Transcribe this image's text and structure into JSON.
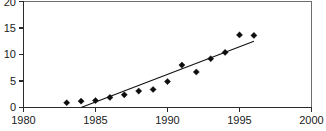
{
  "chart_data": {
    "type": "scatter",
    "title": "",
    "subtitle": "",
    "xlabel": "",
    "ylabel": "",
    "xlim": [
      1980,
      2000
    ],
    "ylim": [
      0,
      20
    ],
    "grid": false,
    "legend": "none",
    "x_ticks": [
      1980,
      1985,
      1990,
      1995,
      2000
    ],
    "x_tick_labels": [
      "1980",
      "1985",
      "1990",
      "1995",
      "2000"
    ],
    "y_ticks": [
      0,
      5,
      10,
      15,
      20
    ],
    "y_tick_labels": [
      "0",
      "5",
      "10",
      "15",
      "20"
    ],
    "series": [
      {
        "name": "data-points",
        "kind": "scatter",
        "marker": "diamond",
        "color": "#0d0d0d",
        "x": [
          1983,
          1984,
          1985,
          1986,
          1987,
          1988,
          1989,
          1990,
          1991,
          1992,
          1993,
          1994,
          1995,
          1996
        ],
        "values": [
          0.9,
          1.2,
          1.3,
          1.9,
          2.4,
          3.1,
          3.4,
          4.9,
          8.0,
          6.7,
          9.2,
          10.4,
          13.7,
          13.6
        ]
      },
      {
        "name": "trend-line",
        "kind": "line",
        "color": "#111111",
        "x": [
          1984.0,
          1996.0
        ],
        "values": [
          0.0,
          12.5
        ]
      }
    ]
  },
  "figure": {
    "background_color": "#ffffff",
    "frame_color": "#6e6e6e",
    "axis_color": "#2b2b2b",
    "marker_color": "#0d0d0d",
    "line_color": "#111111"
  }
}
